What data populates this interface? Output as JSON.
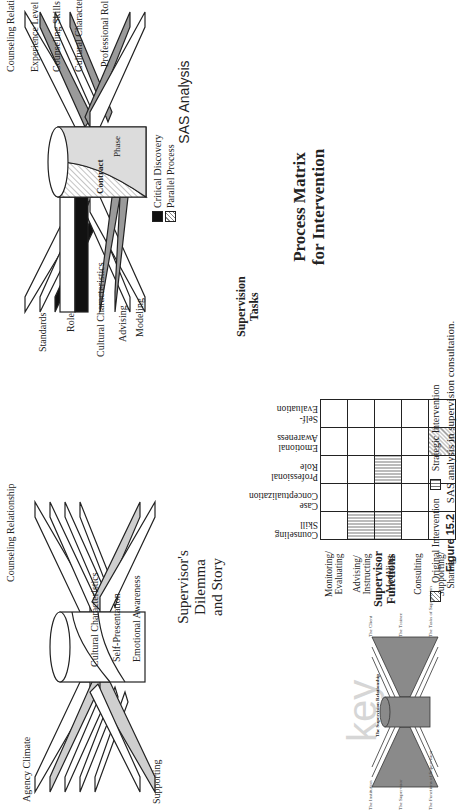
{
  "sas_diagram": {
    "title": "SAS Analysis",
    "center_labels": {
      "contract": "Contract",
      "phase": "Phase"
    },
    "top_labels": [
      "Counseling Relationship",
      "Experience Level",
      "Counseling Skills",
      "Cultural Characteristics",
      "Professional Role"
    ],
    "bottom_labels": [
      "Standards",
      "Role",
      "Cultural Characteristics",
      "Advising",
      "Modeling"
    ],
    "legend": [
      {
        "label": "Critical Discovery",
        "swatch": "solid-black"
      },
      {
        "label": "Parallel Process",
        "swatch": "hatched"
      }
    ]
  },
  "dilemma_diagram": {
    "title_line1": "Supervisor's Dilemma",
    "title_line2": "and Story",
    "top_labels": [
      "Counseling Relationship",
      "Cultural Characteristics",
      "Self-Presentation",
      "Emotional Awareness"
    ],
    "bottom_labels": [
      "Agency Climate",
      "Supporting"
    ]
  },
  "matrix": {
    "title_line1": "Process Matrix",
    "title_line2": "for Intervention",
    "rows_header_line1": "Supervisor",
    "rows_header_line2": "Functions",
    "cols_header_line1": "Supervision",
    "cols_header_line2": "Tasks",
    "columns": [
      "Counseling Skill",
      "Case Conceptualization",
      "Professional Role",
      "Emotional Awareness",
      "Self-Evaluation"
    ],
    "rows": [
      "Monitoring/ Evaluating",
      "Advising/ Instructing",
      "Modeling",
      "Consulting",
      "Supporting/ Sharing"
    ],
    "cells": [
      [
        "",
        "",
        "",
        "",
        ""
      ],
      [
        "strategic",
        "",
        "",
        "",
        ""
      ],
      [
        "strategic",
        "",
        "strategic",
        "",
        ""
      ],
      [
        "",
        "",
        "",
        "",
        ""
      ],
      [
        "",
        "",
        "",
        "original",
        ""
      ]
    ],
    "legend": [
      {
        "label": "Original Intervention",
        "swatch": "hatched"
      },
      {
        "label": "Strategic Intervention",
        "swatch": "vertical-lines"
      }
    ]
  },
  "key_diagram": {
    "watermark": "key",
    "center_label": "The Supervision Relationship",
    "top_labels": [
      "The Client",
      "The Trainee",
      "The Tasks of Supervision"
    ],
    "bottom_labels": [
      "The Institution",
      "The Supervisor",
      "The Functions of Supervision"
    ]
  },
  "caption": {
    "figure_number": "Figure 15.2",
    "text": "SAS analysis in supervision consultation."
  },
  "colors": {
    "band_gray": "#9a9a9a",
    "band_light": "#cfcfcf",
    "key_fill": "#8a8a8a",
    "ink": "#222222"
  }
}
